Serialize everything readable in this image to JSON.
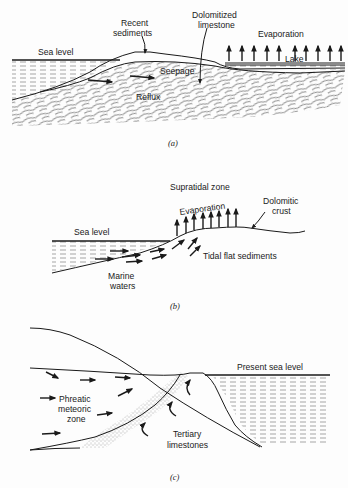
{
  "figure": {
    "panel_a": {
      "caption": "(a)",
      "labels": {
        "sea_level": "Sea level",
        "recent_sediments_1": "Recent",
        "recent_sediments_2": "sediments",
        "dolomitized_1": "Dolomitized",
        "dolomitized_2": "limestone",
        "evaporation": "Evaporation",
        "lake": "Lake",
        "seepage": "Seepage",
        "reflux": "Reflux"
      }
    },
    "panel_b": {
      "caption": "(b)",
      "labels": {
        "supratidal_zone": "Supratidal zone",
        "evaporation": "Evaporation",
        "dolomitic_crust_1": "Dolomitic",
        "dolomitic_crust_2": "crust",
        "sea_level": "Sea level",
        "tidal_flat_sediments": "Tidal flat sediments",
        "marine_waters_1": "Marine",
        "marine_waters_2": "waters"
      }
    },
    "panel_c": {
      "caption": "(c)",
      "labels": {
        "present_sea_level": "Present sea level",
        "phreatic_1": "Phreatic",
        "phreatic_2": "meteoric",
        "phreatic_3": "zone",
        "tertiary_1": "Tertiary",
        "tertiary_2": "limestones"
      }
    }
  }
}
